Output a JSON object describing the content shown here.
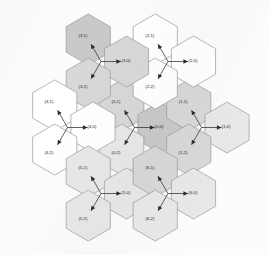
{
  "figure": {
    "title": "",
    "type": "hex-grid-diagram",
    "background_color": "#fcfcfc",
    "hex_orientation": "pointy-top",
    "stroke_color": "#9a9a9a",
    "label_color": "#1a1a1a",
    "arrow_color": "#2b2b2b",
    "shades": {
      "white": "#ffffff",
      "light": "#e8e8e8",
      "medium": "#d8d8d8",
      "dark": "#c9c9c9"
    }
  },
  "geometry": {
    "hex_radius": 25.5,
    "origin_x": 134.5,
    "origin_y": 127.5,
    "arrow_length": 20,
    "arrow_angles_deg": [
      -120,
      0,
      120
    ]
  },
  "clusters": [
    {
      "id": 0,
      "name": "cluster-0",
      "center_x": 134.5,
      "center_y": 127.5,
      "cells": [
        {
          "label": "(0,1)",
          "dir": "up-left",
          "shade": "medium",
          "lx": 116,
          "ly": 103
        },
        {
          "label": "(0,0)",
          "dir": "right",
          "shade": "dark",
          "lx": 159,
          "ly": 128
        },
        {
          "label": "(0,2)",
          "dir": "down-left",
          "shade": "light",
          "lx": 116,
          "ly": 154
        }
      ]
    },
    {
      "id": 1,
      "name": "cluster-1",
      "center_x": 201.5,
      "center_y": 127.5,
      "cells": [
        {
          "label": "(1,1)",
          "dir": "up-left",
          "shade": "medium",
          "lx": 183,
          "ly": 103
        },
        {
          "label": "(1,0)",
          "dir": "right",
          "shade": "light",
          "lx": 226,
          "ly": 128
        },
        {
          "label": "(1,2)",
          "dir": "down-left",
          "shade": "medium",
          "lx": 183,
          "ly": 154
        }
      ]
    },
    {
      "id": 2,
      "name": "cluster-2",
      "center_x": 168.0,
      "center_y": 61.5,
      "cells": [
        {
          "label": "(2,1)",
          "dir": "up-left",
          "shade": "white",
          "lx": 150,
          "ly": 37
        },
        {
          "label": "(2,0)",
          "dir": "right",
          "shade": "white",
          "lx": 193,
          "ly": 62
        },
        {
          "label": "(2,2)",
          "dir": "down-left",
          "shade": "white",
          "lx": 150,
          "ly": 88
        }
      ]
    },
    {
      "id": 3,
      "name": "cluster-3",
      "center_x": 101.0,
      "center_y": 61.5,
      "cells": [
        {
          "label": "(3,1)",
          "dir": "up-left",
          "shade": "dark",
          "lx": 83,
          "ly": 37
        },
        {
          "label": "(3,0)",
          "dir": "right",
          "shade": "medium",
          "lx": 126,
          "ly": 62
        },
        {
          "label": "(3,2)",
          "dir": "down-left",
          "shade": "medium",
          "lx": 83,
          "ly": 88
        }
      ]
    },
    {
      "id": 4,
      "name": "cluster-4",
      "center_x": 67.5,
      "center_y": 127.5,
      "cells": [
        {
          "label": "(4,1)",
          "dir": "up-left",
          "shade": "white",
          "lx": 49,
          "ly": 103
        },
        {
          "label": "(4,0)",
          "dir": "right",
          "shade": "white",
          "lx": 92,
          "ly": 128
        },
        {
          "label": "(4,2)",
          "dir": "down-left",
          "shade": "white",
          "lx": 49,
          "ly": 154
        }
      ]
    },
    {
      "id": 5,
      "name": "cluster-5",
      "center_x": 101.0,
      "center_y": 193.5,
      "cells": [
        {
          "label": "(5,1)",
          "dir": "up-left",
          "shade": "light",
          "lx": 83,
          "ly": 169
        },
        {
          "label": "(5,0)",
          "dir": "right",
          "shade": "light",
          "lx": 126,
          "ly": 194
        },
        {
          "label": "(5,2)",
          "dir": "down-left",
          "shade": "light",
          "lx": 83,
          "ly": 220
        }
      ]
    },
    {
      "id": 6,
      "name": "cluster-6",
      "center_x": 168.0,
      "center_y": 193.5,
      "cells": [
        {
          "label": "(6,1)",
          "dir": "up-left",
          "shade": "medium",
          "lx": 150,
          "ly": 169
        },
        {
          "label": "(6,0)",
          "dir": "right",
          "shade": "light",
          "lx": 193,
          "ly": 194
        },
        {
          "label": "(6,2)",
          "dir": "down-left",
          "shade": "light",
          "lx": 150,
          "ly": 220
        }
      ]
    }
  ]
}
